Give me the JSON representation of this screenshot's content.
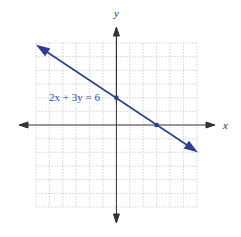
{
  "graph": {
    "equation_label": "2x + 3y = 6",
    "x_axis_label": "x",
    "y_axis_label": "y",
    "grid_range": {
      "x": [
        -6,
        6
      ],
      "y": [
        -6,
        6
      ]
    },
    "points": [
      {
        "name": "y-intercept",
        "x": 0,
        "y": 2
      },
      {
        "name": "x-intercept",
        "x": 3,
        "y": 0
      }
    ],
    "colors": {
      "line": "#2b3f8f",
      "axes": "#333333",
      "grid": "#c8c8c8",
      "label": "#3a4a9a"
    }
  }
}
